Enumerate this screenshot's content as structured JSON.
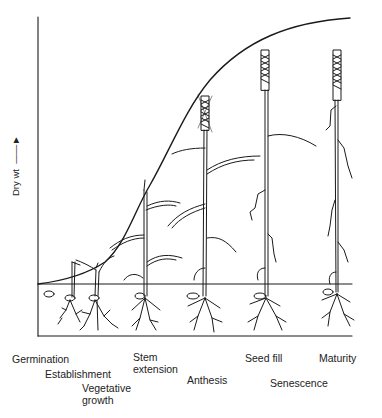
{
  "diagram": {
    "y_axis_label": "Dry wt",
    "curve": "sigmoid dry weight accumulation",
    "stages": [
      {
        "id": "germination",
        "label": "Germination"
      },
      {
        "id": "establishment",
        "label": "Establishment"
      },
      {
        "id": "vegetative",
        "label": "Vegetative growth",
        "line1": "Vegetative",
        "line2": "growth"
      },
      {
        "id": "stem",
        "label": "Stem extension",
        "line1": "Stem",
        "line2": "extension"
      },
      {
        "id": "anthesis",
        "label": "Anthesis"
      },
      {
        "id": "seedfill",
        "label": "Seed fill"
      },
      {
        "id": "senescence",
        "label": "Senescence"
      },
      {
        "id": "maturity",
        "label": "Maturity"
      }
    ]
  }
}
